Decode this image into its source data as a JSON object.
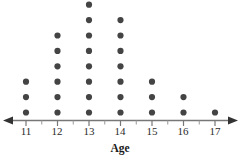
{
  "chart_data": {
    "type": "scatter",
    "plot_style": "dot-plot",
    "title": "",
    "xlabel": "Age",
    "ylabel": "",
    "grid": false,
    "legend": null,
    "xlim": [
      10.6,
      17.45
    ],
    "ylim": [
      0,
      8
    ],
    "categories": [
      "11",
      "12",
      "13",
      "14",
      "15",
      "16",
      "17"
    ],
    "values": [
      3,
      6,
      8,
      7,
      3,
      2,
      1
    ],
    "total_count": 30,
    "tick_labels": [
      "11",
      "12",
      "13",
      "14",
      "15",
      "16",
      "17"
    ],
    "minor_ticks": [
      "11.5",
      "12.5",
      "13.5",
      "14.5",
      "15.5",
      "16.5"
    ],
    "axis_arrows": "both",
    "dot_color": "#444444",
    "axis_color": "#777777",
    "points": [
      {
        "x": "11",
        "count": 3
      },
      {
        "x": "12",
        "count": 6
      },
      {
        "x": "13",
        "count": 8
      },
      {
        "x": "14",
        "count": 7
      },
      {
        "x": "15",
        "count": 3
      },
      {
        "x": "16",
        "count": 2
      },
      {
        "x": "17",
        "count": 1
      }
    ]
  },
  "labels": {
    "axis_title": "Age",
    "t11": "11",
    "t12": "12",
    "t13": "13",
    "t14": "14",
    "t15": "15",
    "t16": "16",
    "t17": "17"
  }
}
